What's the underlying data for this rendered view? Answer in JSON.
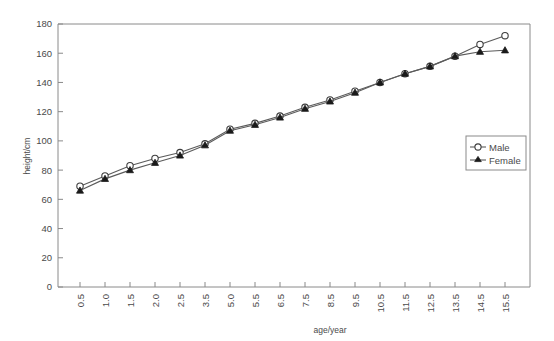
{
  "chart_data": {
    "type": "line",
    "title": "",
    "xlabel": "age/year",
    "ylabel": "height/cm",
    "categories": [
      "0.5",
      "1.0",
      "1.5",
      "2.0",
      "2.5",
      "3.5",
      "5.0",
      "5.5",
      "6.5",
      "7.5",
      "8.5",
      "9.5",
      "10.5",
      "11.5",
      "12.5",
      "13.5",
      "14.5",
      "15.5"
    ],
    "ylim": [
      0,
      180
    ],
    "yticks": [
      "0",
      "20",
      "40",
      "60",
      "80",
      "100",
      "120",
      "140",
      "160",
      "180"
    ],
    "ytick_values": [
      0,
      20,
      40,
      60,
      80,
      100,
      120,
      140,
      160,
      180
    ],
    "grid": false,
    "legend_position": "right-middle",
    "series": [
      {
        "name": "Male",
        "marker": "open-circle",
        "values": [
          69,
          76,
          83,
          88,
          92,
          98,
          108,
          112,
          117,
          123,
          128,
          134,
          140,
          146,
          151,
          158,
          166,
          172
        ]
      },
      {
        "name": "Female",
        "marker": "filled-triangle",
        "values": [
          66,
          74,
          80,
          85,
          90,
          97,
          107,
          111,
          116,
          122,
          127,
          133,
          140,
          146,
          151,
          158,
          161,
          162
        ]
      }
    ]
  },
  "legend": {
    "entries": [
      {
        "label": "Male",
        "marker": "open-circle"
      },
      {
        "label": "Female",
        "marker": "filled-triangle"
      }
    ]
  }
}
